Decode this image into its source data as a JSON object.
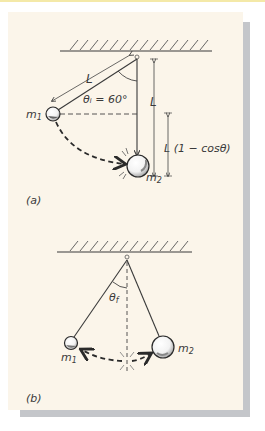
{
  "figure": {
    "colors": {
      "panel_background": "#fbf5ea",
      "shadow": "#c4c6ca",
      "ink": "#3a3a3a",
      "top_strip": "#f4e9a8"
    },
    "part_a": {
      "caption": "(a)",
      "string_length_label": "L",
      "initial_angle_label": "θᵢ = 60°",
      "vertical_length_label": "L",
      "height_label": "L (1 − cosθ)",
      "mass1_label": "m",
      "mass1_subscript": "1",
      "mass2_label": "m",
      "mass2_subscript": "2"
    },
    "part_b": {
      "caption": "(b)",
      "final_angle_label": "θ",
      "final_angle_subscript": "f",
      "mass1_label": "m",
      "mass1_subscript": "1",
      "mass2_label": "m",
      "mass2_subscript": "2"
    }
  }
}
